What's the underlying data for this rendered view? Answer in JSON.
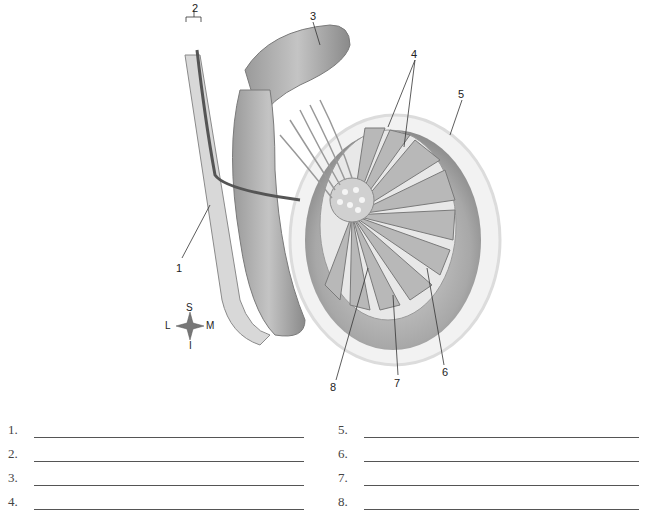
{
  "figure": {
    "callouts": [
      {
        "num": "1",
        "x": 176,
        "y": 262
      },
      {
        "num": "2",
        "x": 192,
        "y": 7
      },
      {
        "num": "3",
        "x": 310,
        "y": 14
      },
      {
        "num": "4",
        "x": 411,
        "y": 51
      },
      {
        "num": "5",
        "x": 458,
        "y": 94
      },
      {
        "num": "6",
        "x": 445,
        "y": 370
      },
      {
        "num": "7",
        "x": 397,
        "y": 380
      },
      {
        "num": "8",
        "x": 330,
        "y": 385
      }
    ],
    "compass": {
      "superior": "S",
      "inferior": "I",
      "lateral": "L",
      "medial": "M"
    }
  },
  "answer_sheet": {
    "left": [
      {
        "label": "1.",
        "value": ""
      },
      {
        "label": "2.",
        "value": ""
      },
      {
        "label": "3.",
        "value": ""
      },
      {
        "label": "4.",
        "value": ""
      }
    ],
    "right": [
      {
        "label": "5.",
        "value": ""
      },
      {
        "label": "6.",
        "value": ""
      },
      {
        "label": "7.",
        "value": ""
      },
      {
        "label": "8.",
        "value": ""
      }
    ]
  }
}
